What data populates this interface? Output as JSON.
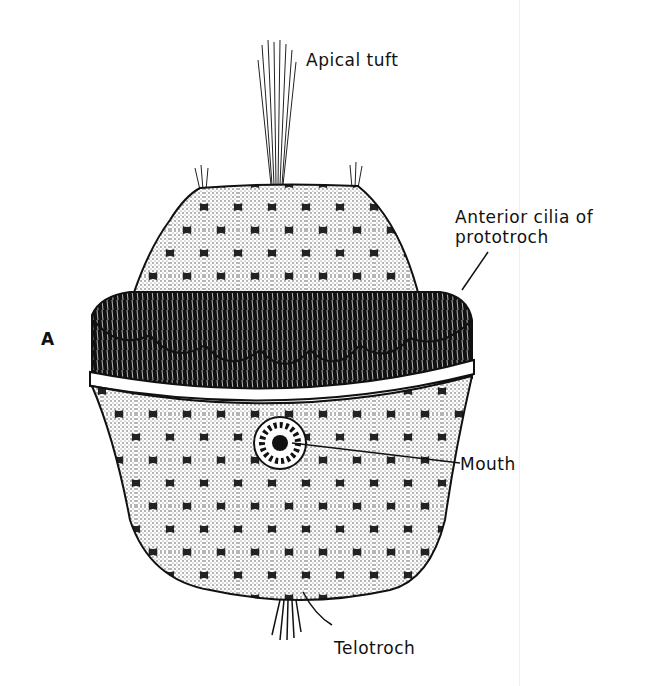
{
  "figure": {
    "panel_letter": "A",
    "labels": {
      "apical_tuft": "Apical tuft",
      "anterior_cilia_line1": "Anterior cilia of",
      "anterior_cilia_line2": "prototroch",
      "mouth": "Mouth",
      "telotroch": "Telotroch"
    },
    "colors": {
      "ink": "#111111",
      "stipple": "#444444",
      "cell": "#f4f4f4",
      "background": "#ffffff"
    }
  }
}
